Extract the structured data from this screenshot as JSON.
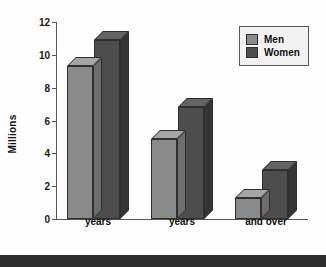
{
  "chart_data": {
    "type": "bar",
    "title": "",
    "subtitle": "",
    "xlabel": "",
    "ylabel": "Millions",
    "categories": [
      "65–74\nyears",
      "75–84\nyears",
      "85+ years\nand over"
    ],
    "series": [
      {
        "name": "Men",
        "values": [
          9.3,
          4.9,
          1.3
        ],
        "color": "#8a8a8a"
      },
      {
        "name": "Women",
        "values": [
          10.9,
          6.8,
          3.0
        ],
        "color": "#4d4d4d"
      }
    ],
    "ylim": [
      0,
      12
    ],
    "yticks": [
      0,
      2,
      4,
      6,
      8,
      10,
      12
    ],
    "ytick_labels": [
      "0",
      "2",
      "4",
      "6",
      "8",
      "10",
      "12"
    ],
    "grid": false,
    "legend_position": "top-right",
    "style": "3d-bars"
  },
  "axis": {
    "y_title": "Millions"
  },
  "legend": {
    "items": [
      {
        "label": "Men",
        "color": "#8a8a8a"
      },
      {
        "label": "Women",
        "color": "#4d4d4d"
      }
    ]
  },
  "colors": {
    "background": "#fdfdfd",
    "axis": "#555555",
    "text": "#111111",
    "men": "#8a8a8a",
    "men_top": "#a5a5a5",
    "men_side": "#6e6e6e",
    "women": "#4d4d4d",
    "women_top": "#646464",
    "women_side": "#353535",
    "band": "#2e2e2e"
  }
}
